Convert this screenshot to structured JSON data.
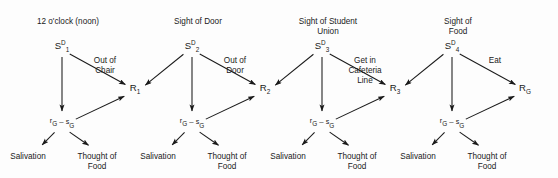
{
  "diagram": {
    "type": "behavior-chain-diagram",
    "background_color": "#fdfdfd",
    "stroke_color": "#1a1a1a",
    "arrow_marker": "filled-triangle",
    "units": [
      {
        "id": "unit-1",
        "cue_label": "12 o'clock (noon)",
        "cue_label_lines": [
          "12 o'clock (noon)"
        ],
        "stimulus_node": {
          "base": "S",
          "superscript": "D",
          "subscript": "1"
        },
        "act_label_lines": [
          "Out of",
          "Chair"
        ],
        "response_node": {
          "base": "R",
          "subscript": "1"
        },
        "mediator_node": {
          "left_sup": "r",
          "left_sub": "G",
          "dash": "–",
          "right_sup": "s",
          "right_sub": "G"
        },
        "outcomes": [
          {
            "label_lines": [
              "Salivation"
            ]
          },
          {
            "label_lines": [
              "Thought of",
              "Food"
            ]
          }
        ]
      },
      {
        "id": "unit-2",
        "cue_label": "Sight of Door",
        "cue_label_lines": [
          "Sight of Door"
        ],
        "stimulus_node": {
          "base": "S",
          "superscript": "D",
          "subscript": "2"
        },
        "act_label_lines": [
          "Out of",
          "Door"
        ],
        "response_node": {
          "base": "R",
          "subscript": "2"
        },
        "mediator_node": {
          "left_sup": "r",
          "left_sub": "G",
          "dash": "–",
          "right_sup": "s",
          "right_sub": "G"
        },
        "outcomes": [
          {
            "label_lines": [
              "Salivation"
            ]
          },
          {
            "label_lines": [
              "Thought of",
              "Food"
            ]
          }
        ]
      },
      {
        "id": "unit-3",
        "cue_label": "Sight of Student Union",
        "cue_label_lines": [
          "Sight of Student",
          "Union"
        ],
        "stimulus_node": {
          "base": "S",
          "superscript": "D",
          "subscript": "3"
        },
        "act_label_lines": [
          "Get in",
          "Cafeteria",
          "Line"
        ],
        "response_node": {
          "base": "R",
          "subscript": "3"
        },
        "mediator_node": {
          "left_sup": "r",
          "left_sub": "G",
          "dash": "–",
          "right_sup": "s",
          "right_sub": "G"
        },
        "outcomes": [
          {
            "label_lines": [
              "Salivation"
            ]
          },
          {
            "label_lines": [
              "Thought of",
              "Food"
            ]
          }
        ]
      },
      {
        "id": "unit-4",
        "cue_label": "Sight of Food",
        "cue_label_lines": [
          "Sight of",
          "Food"
        ],
        "stimulus_node": {
          "base": "S",
          "superscript": "D",
          "subscript": "4"
        },
        "act_label_lines": [
          "Eat"
        ],
        "response_node": {
          "base": "R",
          "subscript": "G"
        },
        "mediator_node": {
          "left_sup": "r",
          "left_sub": "G",
          "dash": "–",
          "right_sup": "s",
          "right_sub": "G"
        },
        "outcomes": [
          {
            "label_lines": [
              "Salivation"
            ]
          },
          {
            "label_lines": [
              "Thought of",
              "Food"
            ]
          }
        ]
      }
    ],
    "geometry": {
      "unit_x_offsets": [
        0,
        130,
        260,
        390
      ],
      "stimulus": {
        "x": 62,
        "y": 49
      },
      "response": {
        "x": 135,
        "y": 91
      },
      "mediator": {
        "x": 62,
        "y": 126
      },
      "cue": {
        "x": 68,
        "y": 24
      },
      "act": {
        "x": 105,
        "y": 63
      },
      "outcome_left": {
        "x": 28,
        "y": 159
      },
      "outcome_right": {
        "x": 97,
        "y": 159
      },
      "line_height": 10
    }
  }
}
